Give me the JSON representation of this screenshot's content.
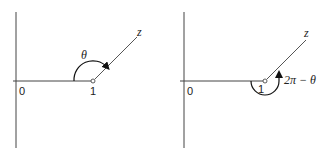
{
  "panels": [
    {
      "origin_label": "0",
      "point_label": "1",
      "ray_label": "z",
      "angle_label": "θ",
      "angle_direction": "counterclockwise-upper"
    },
    {
      "origin_label": "0",
      "point_label": "1",
      "ray_label": "z",
      "angle_label": "2π − θ",
      "angle_direction": "clockwise-lower"
    }
  ],
  "colors": {
    "axis": "#444444",
    "arc": "#111111",
    "background": "#ffffff"
  }
}
